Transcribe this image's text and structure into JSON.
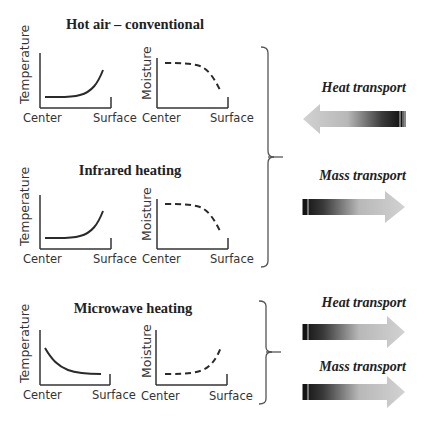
{
  "panels": [
    {
      "title": "Hot air – conventional",
      "temperature_chart": {
        "ylabel": "Temperature",
        "xlabel_left": "Center",
        "xlabel_right": "Surface",
        "curve": "flat-then-rising toward surface",
        "line_style": "solid"
      },
      "moisture_chart": {
        "ylabel": "Moisture",
        "xlabel_left": "Center",
        "xlabel_right": "Surface",
        "curve": "flat-then-falling toward surface",
        "line_style": "dashed"
      }
    },
    {
      "title": "Infrared heating",
      "temperature_chart": {
        "ylabel": "Temperature",
        "xlabel_left": "Center",
        "xlabel_right": "Surface",
        "curve": "flat-then-rising toward surface",
        "line_style": "solid"
      },
      "moisture_chart": {
        "ylabel": "Moisture",
        "xlabel_left": "Center",
        "xlabel_right": "Surface",
        "curve": "flat-then-falling toward surface",
        "line_style": "dashed"
      }
    },
    {
      "title": "Microwave heating",
      "temperature_chart": {
        "ylabel": "Temperature",
        "xlabel_left": "Center",
        "xlabel_right": "Surface",
        "curve": "high at center, falling toward surface",
        "line_style": "solid"
      },
      "moisture_chart": {
        "ylabel": "Moisture",
        "xlabel_left": "Center",
        "xlabel_right": "Surface",
        "curve": "flat-then-rising toward surface",
        "line_style": "dashed"
      }
    }
  ],
  "groups": [
    {
      "applies_to": [
        "Hot air – conventional",
        "Infrared heating"
      ],
      "arrows": [
        {
          "label": "Heat transport",
          "direction": "left"
        },
        {
          "label": "Mass transport",
          "direction": "right"
        }
      ]
    },
    {
      "applies_to": [
        "Microwave heating"
      ],
      "arrows": [
        {
          "label": "Heat transport",
          "direction": "right"
        },
        {
          "label": "Mass transport",
          "direction": "right"
        }
      ]
    }
  ],
  "colors": {
    "line": "#2a2a2a",
    "axis": "#333333",
    "arrow_dark": "#1a1a1a",
    "arrow_light": "#cfcfcf",
    "bracket": "#555555"
  }
}
